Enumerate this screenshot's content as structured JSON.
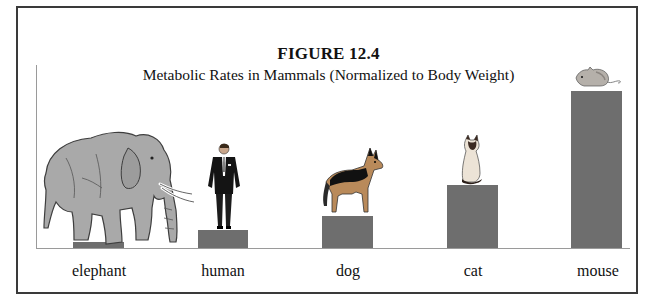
{
  "figure": {
    "number_label": "FIGURE 12.4",
    "subtitle": "Metabolic Rates in Mammals (Normalized to Body Weight)"
  },
  "colors": {
    "bar": "#6e6e6e",
    "axis": "#9a9a9a",
    "frame": "#3a3a3a"
  },
  "chart_data": {
    "type": "bar",
    "title": "FIGURE 12.4",
    "subtitle": "Metabolic Rates in Mammals (Normalized to Body Weight)",
    "xlabel": "",
    "ylabel": "",
    "categories": [
      "elephant",
      "human",
      "dog",
      "cat",
      "mouse"
    ],
    "values": [
      6,
      18,
      32,
      63,
      157
    ],
    "value_units": "relative (no numeric axis shown; estimated from bar heights in px)",
    "ylim": [
      0,
      184
    ],
    "grid": false,
    "legend": null,
    "annotations": [
      "elephant illustration",
      "man in suit illustration",
      "German shepherd illustration",
      "Siamese cat illustration",
      "mouse illustration"
    ]
  },
  "labels": [
    "elephant",
    "human",
    "dog",
    "cat",
    "mouse"
  ]
}
